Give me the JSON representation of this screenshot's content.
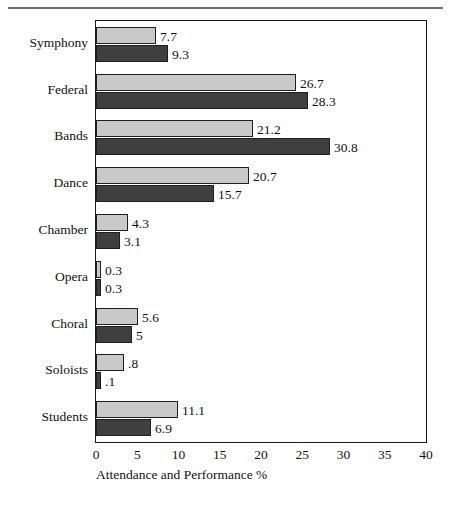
{
  "chart_data": {
    "type": "bar",
    "orientation": "horizontal",
    "title": "",
    "xlabel": "Attendance and Performance %",
    "ylabel": "",
    "xlim": [
      0,
      40
    ],
    "xticks": [
      0,
      5,
      10,
      15,
      20,
      25,
      30,
      35,
      40
    ],
    "grid": false,
    "legend": "none",
    "categories": [
      "Symphony",
      "Federal",
      "Bands",
      "Dance",
      "Chamber",
      "Opera",
      "Choral",
      "Soloists",
      "Students"
    ],
    "series": [
      {
        "name": "Attendance",
        "color": "#c9c9c9",
        "values": [
          7.7,
          26.7,
          21.2,
          20.7,
          4.3,
          0.3,
          5.6,
          0.8,
          11.1
        ],
        "labels": [
          "7.7",
          "26.7",
          "21.2",
          "20.7",
          "4.3",
          "0.3",
          "5.6",
          ".8",
          "11.1"
        ],
        "bar_px": [
          60,
          200,
          157,
          153,
          32,
          5,
          42,
          28,
          82
        ]
      },
      {
        "name": "Performance",
        "color": "#3f3f3f",
        "values": [
          9.3,
          28.3,
          30.8,
          15.7,
          3.1,
          0.3,
          5.0,
          0.1,
          6.9
        ],
        "labels": [
          "9.3",
          "28.3",
          "30.8",
          "15.7",
          "3.1",
          "0.3",
          "5",
          ".1",
          "6.9"
        ],
        "bar_px": [
          72,
          212,
          234,
          118,
          24,
          5,
          36,
          5,
          55
        ]
      }
    ]
  },
  "axis": {
    "tick_labels": [
      "0",
      "5",
      "10",
      "15",
      "20",
      "25",
      "30",
      "35",
      "40"
    ],
    "title": "Attendance and Performance %"
  },
  "colors": {
    "light_bar": "#c9c9c9",
    "dark_bar": "#3f3f3f",
    "frame": "#1a1a1a",
    "rule": "#6e6e6e",
    "text": "#111111",
    "background": "#ffffff"
  }
}
